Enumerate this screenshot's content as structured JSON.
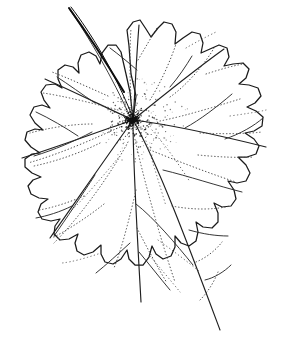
{
  "figure": {
    "kind": "botanical-line-drawing",
    "caption": "",
    "background_color": "#ffffff",
    "ink_color": "#1a1a1a",
    "canvas": {
      "width": 292,
      "height": 353
    }
  },
  "drawing": {
    "petiole": {
      "label": "petiole",
      "start": [
        68,
        8
      ],
      "end": [
        133,
        120
      ],
      "stroke_width_top": 2.2,
      "stroke_width_bottom": 0.9,
      "color": "#0d0d0d"
    },
    "center_node": {
      "label": "vein junction",
      "x": 133,
      "y": 120,
      "stipple_count": 520,
      "stipple_radius": 46
    },
    "blade": {
      "label": "leaf blade",
      "bounds": {
        "left": 13,
        "top": 19,
        "right": 279,
        "bottom": 336
      },
      "lobe_count": 7,
      "margin": "dentate-crenate"
    },
    "primary_veins": [
      {
        "name": "midrib-upper",
        "to": [
          144,
          22
        ]
      },
      {
        "name": "vein-upper-right",
        "to": [
          233,
          47
        ]
      },
      {
        "name": "vein-right",
        "to": [
          272,
          143
        ]
      },
      {
        "name": "vein-lower-right",
        "to": [
          222,
          332
        ]
      },
      {
        "name": "vein-lower",
        "to": [
          142,
          308
        ]
      },
      {
        "name": "vein-lower-left",
        "to": [
          47,
          240
        ]
      },
      {
        "name": "vein-left",
        "to": [
          18,
          155
        ]
      },
      {
        "name": "vein-upper-left",
        "to": [
          41,
          78
        ]
      }
    ],
    "vein_style": {
      "primary": "solid",
      "secondary": "solid-thin",
      "tertiary": "dotted"
    }
  }
}
